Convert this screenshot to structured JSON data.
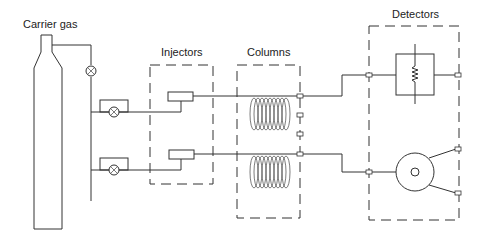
{
  "diagram": {
    "type": "gas-chromatography-schematic",
    "labels": {
      "carrier_gas": "Carrier gas",
      "injectors": "Injectors",
      "columns": "Columns",
      "detectors": "Detectors"
    },
    "components": {
      "gas_cylinder": "carrier gas cylinder",
      "main_valve": "flow valve",
      "branch_valves": [
        "upper flow controller valve",
        "lower flow controller valve"
      ],
      "injectors": [
        "upper injector",
        "lower injector"
      ],
      "columns": [
        "upper coiled column",
        "lower coiled column"
      ],
      "detectors": [
        "resistive detector (TCD)",
        "ionization detector (FID)"
      ]
    },
    "colors": {
      "line": "#333333",
      "background": "#ffffff"
    }
  }
}
